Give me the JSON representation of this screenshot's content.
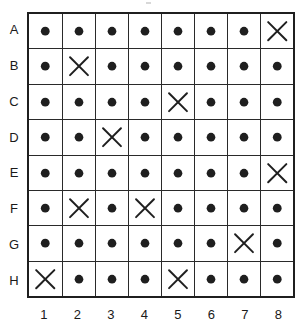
{
  "figure": {
    "type": "grid-matrix",
    "rows": 8,
    "columns": 8,
    "row_labels": [
      "A",
      "B",
      "C",
      "D",
      "E",
      "F",
      "G",
      "H"
    ],
    "column_labels": [
      "1",
      "2",
      "3",
      "4",
      "5",
      "6",
      "7",
      "8"
    ],
    "symbols": {
      "dot": "filled-circle",
      "cross": "x-mark"
    },
    "colors": {
      "ink": "#1f1f1f",
      "grid_line": "#2a2a2a",
      "background": "#ffffff"
    },
    "cells": [
      [
        "dot",
        "dot",
        "dot",
        "dot",
        "dot",
        "dot",
        "dot",
        "cross"
      ],
      [
        "dot",
        "cross",
        "dot",
        "dot",
        "dot",
        "dot",
        "dot",
        "dot"
      ],
      [
        "dot",
        "dot",
        "dot",
        "dot",
        "cross",
        "dot",
        "dot",
        "dot"
      ],
      [
        "dot",
        "dot",
        "cross",
        "dot",
        "dot",
        "dot",
        "dot",
        "dot"
      ],
      [
        "dot",
        "dot",
        "dot",
        "dot",
        "dot",
        "dot",
        "dot",
        "cross"
      ],
      [
        "dot",
        "cross",
        "dot",
        "cross",
        "dot",
        "dot",
        "dot",
        "dot"
      ],
      [
        "dot",
        "dot",
        "dot",
        "dot",
        "dot",
        "dot",
        "cross",
        "dot"
      ],
      [
        "cross",
        "dot",
        "dot",
        "dot",
        "cross",
        "dot",
        "dot",
        "dot"
      ]
    ]
  }
}
